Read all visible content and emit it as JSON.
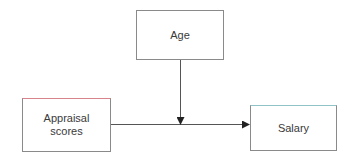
{
  "diagram": {
    "type": "moderation-model",
    "nodes": [
      {
        "id": "age",
        "label": "Age",
        "role": "moderator"
      },
      {
        "id": "appraisal",
        "label": "Appraisal\nscores",
        "role": "independent-variable"
      },
      {
        "id": "salary",
        "label": "Salary",
        "role": "dependent-variable"
      }
    ],
    "edges": [
      {
        "from": "appraisal",
        "to": "salary",
        "style": "arrow"
      },
      {
        "from": "age",
        "to": "appraisal->salary",
        "style": "arrow"
      }
    ],
    "colors": {
      "border": "#8a8a8a",
      "line": "#555555",
      "text": "#3a3a3a",
      "appraisal_top_border": "#d9848c",
      "salary_top_border": "#8fc3c8"
    }
  }
}
